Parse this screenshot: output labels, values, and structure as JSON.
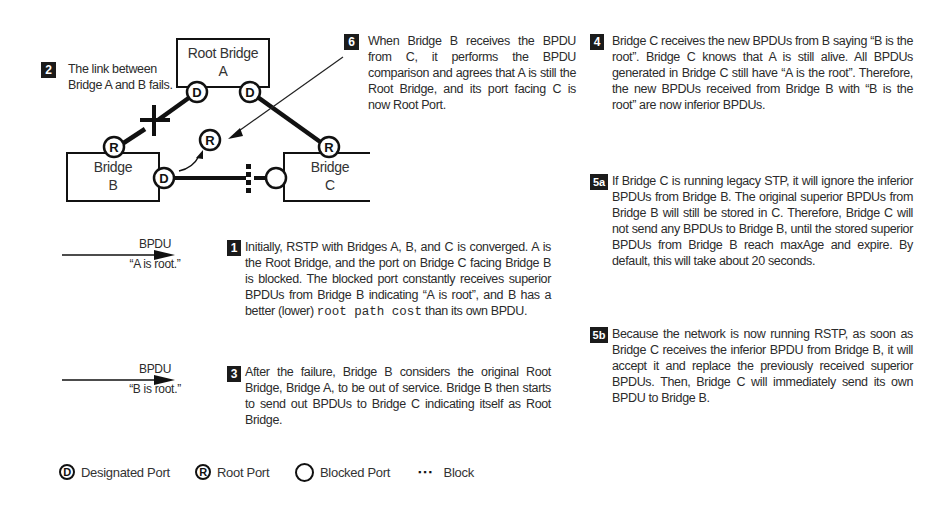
{
  "diagram": {
    "bridges": [
      {
        "id": "A",
        "line1": "Root Bridge",
        "line2": "A"
      },
      {
        "id": "B",
        "line1": "Bridge",
        "line2": "B"
      },
      {
        "id": "C",
        "line1": "Bridge",
        "line2": "C"
      }
    ],
    "ports": {
      "designated": "D",
      "root": "R"
    },
    "links": [
      {
        "from": "A",
        "to": "B",
        "state": "failed"
      },
      {
        "from": "A",
        "to": "C",
        "state": "forwarding"
      },
      {
        "from": "B",
        "to": "C",
        "state": "blocked"
      }
    ]
  },
  "steps": {
    "step1": {
      "badge": "1",
      "text_before": "Initially, RSTP with Bridges A, B, and C is converged. A is the Root Bridge, and the port on Bridge C facing Bridge B is blocked. The blocked port constantly receives superior BPDUs from Bridge B indicating “A is root”, and B has a better (lower) ",
      "code": "root path cost",
      "text_after": " than its own BPDU."
    },
    "step2": {
      "badge": "2",
      "text": "The link between Bridge A and B fails."
    },
    "step3": {
      "badge": "3",
      "text": "After the failure, Bridge B considers the original Root Bridge, Bridge A, to be out of service. Bridge B then starts to send out BPDUs to Bridge C indicating itself as Root Bridge."
    },
    "step4": {
      "badge": "4",
      "text": "Bridge C receives the new BPDUs from B saying “B is the root”. Bridge C knows that A is still alive. All BPDUs generated in Bridge C still have “A is the root”. Therefore, the new BPDUs received from Bridge B with “B is the root” are now inferior BPDUs."
    },
    "step5a": {
      "badge": "5a",
      "text": "If Bridge C is running legacy STP, it will ignore the inferior BPDUs from Bridge B. The original superior BPDUs from Bridge B will still be stored in C. Therefore, Bridge C will not send any BPDUs to Bridge B, until the stored superior BPDUs from Bridge B reach maxAge and expire. By default, this will take about 20 seconds."
    },
    "step5b": {
      "badge": "5b",
      "text": "Because the network is now running RSTP, as soon as Bridge C receives the inferior BPDU from Bridge B, it will accept it and replace the previously received superior BPDUs. Then, Bridge C will immediately send its own BPDU to Bridge B."
    },
    "step6": {
      "badge": "6",
      "text": "When Bridge B receives the BPDU from C, it performs the BPDU comparison and agrees that A is still the Root Bridge, and its port facing C is now Root Port."
    }
  },
  "bpdu_arrows": [
    {
      "label": "BPDU",
      "content": "“A is root.”"
    },
    {
      "label": "BPDU",
      "content": "“B is root.”"
    }
  ],
  "legend": [
    {
      "symbol": "D",
      "label": "Designated Port"
    },
    {
      "symbol": "R",
      "label": "Root Port"
    },
    {
      "symbol": "",
      "label": "Blocked Port"
    },
    {
      "symbol": "▪▪▪",
      "label": "Block"
    }
  ]
}
